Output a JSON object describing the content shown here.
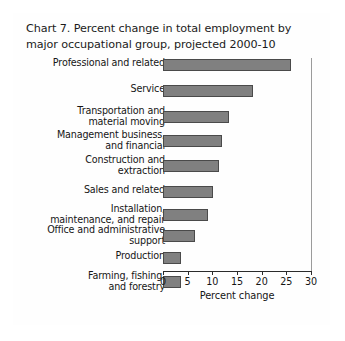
{
  "figure": {
    "title_lines": [
      "Chart 7. Percent change in total employment by",
      "major occupational group, projected 2000-10"
    ],
    "frame_color": "#3a3a3a",
    "bar_fill_color": "#808080",
    "bar_border_color": "#4a4a4a",
    "axis_color": "#2b2b2b"
  },
  "chart_data": {
    "type": "bar",
    "orientation": "horizontal",
    "title": "Chart 7. Percent change in total employment by major occupational group, projected 2000-10",
    "xlabel": "Percent change",
    "ylabel": "",
    "xlim": [
      0,
      30
    ],
    "xticks": [
      0,
      5,
      10,
      15,
      20,
      25,
      30
    ],
    "xtick_labels": [
      "0",
      "5",
      "10",
      "15",
      "20",
      "25",
      "30"
    ],
    "grid": false,
    "legend": null,
    "categories": [
      "Professional and related",
      "Service",
      "Transportation and material moving",
      "Management business, and financial",
      "Construction and extraction",
      "Sales and related",
      "Installation, maintenance, and repair",
      "Office and administrative support",
      "Production",
      "Farming, fishing, and forestry"
    ],
    "category_label_lines": [
      [
        "Professional and related"
      ],
      [
        "Service"
      ],
      [
        "Transportation and",
        "material moving"
      ],
      [
        "Management business,",
        "and financial"
      ],
      [
        "Construction and",
        "extraction"
      ],
      [
        "Sales and related"
      ],
      [
        "Installation,",
        "maintenance, and repair"
      ],
      [
        "Office and administrative",
        "support"
      ],
      [
        "Production"
      ],
      [
        "Farming, fishing,",
        "and forestry"
      ]
    ],
    "values": [
      26.0,
      18.2,
      13.3,
      11.9,
      11.3,
      10.1,
      9.1,
      6.4,
      3.7,
      3.7
    ]
  }
}
